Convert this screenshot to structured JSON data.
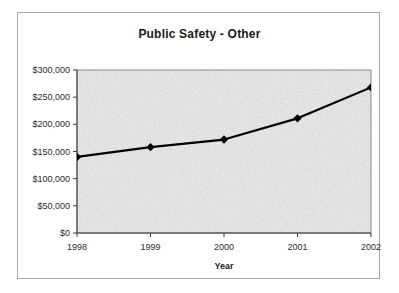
{
  "chart_data": {
    "type": "line",
    "title": "Public Safety - Other",
    "xlabel": "Year",
    "ylabel": "",
    "categories": [
      "1998",
      "1999",
      "2000",
      "2001",
      "2002"
    ],
    "x": [
      1998,
      1999,
      2000,
      2001,
      2002
    ],
    "values": [
      140000,
      158000,
      172000,
      211000,
      268000
    ],
    "series": [
      {
        "name": "Public Safety - Other",
        "values": [
          140000,
          158000,
          172000,
          211000,
          268000
        ]
      }
    ],
    "ylim": [
      0,
      300000
    ],
    "ytick_values": [
      0,
      50000,
      100000,
      150000,
      200000,
      250000,
      300000
    ],
    "ytick_labels": [
      "$0",
      "$50,000",
      "$100,000",
      "$150,000",
      "$200,000",
      "$250,000",
      "$300,000"
    ],
    "xtick_labels": [
      "1998",
      "1999",
      "2000",
      "2001",
      "2002"
    ],
    "grid": false,
    "legend": false,
    "legend_position": "none",
    "marker": "diamond",
    "line_color": "#000000",
    "plot_background": "#d4d4d4",
    "border_color": "#a9a9a9",
    "text_color": "#1a1a1a"
  }
}
